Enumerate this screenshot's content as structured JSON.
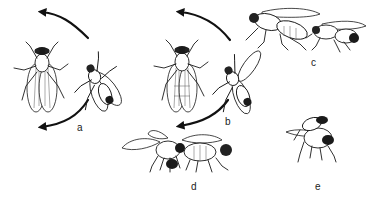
{
  "figure": {
    "panels": [
      {
        "id": "a",
        "label": "a",
        "x": 77,
        "y": 123
      },
      {
        "id": "b",
        "label": "b",
        "x": 225,
        "y": 117
      },
      {
        "id": "c",
        "label": "c",
        "x": 311,
        "y": 58
      },
      {
        "id": "d",
        "label": "d",
        "x": 191,
        "y": 182
      },
      {
        "id": "e",
        "label": "e",
        "x": 315,
        "y": 182
      }
    ],
    "colors": {
      "ink": "#1a1a1a",
      "background": "#ffffff"
    }
  }
}
